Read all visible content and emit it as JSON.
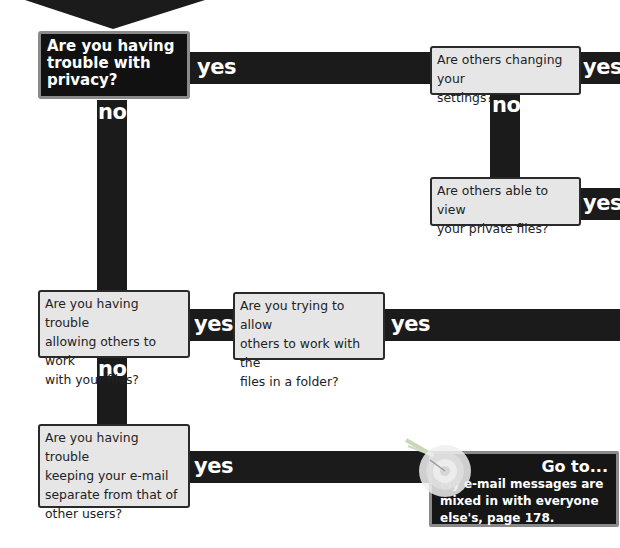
{
  "flowchart": {
    "start": {
      "question": "Are you having trouble with privacy?",
      "lines": [
        "Are you having",
        "trouble with",
        "privacy?"
      ],
      "yes_label": "yes",
      "no_label": "no"
    },
    "settings": {
      "question": "Are others changing your settings?",
      "lines": [
        "Are others changing your",
        "settings?"
      ],
      "yes_label": "yes",
      "no_label": "no"
    },
    "private_files": {
      "question": "Are others able to view your private files?",
      "lines": [
        "Are others able to view",
        "your private files?"
      ],
      "yes_label": "yes"
    },
    "work_files": {
      "question": "Are you having trouble allowing others to work with your files?",
      "lines": [
        "Are you having trouble",
        "allowing others to work",
        "with your files?"
      ],
      "yes_label": "yes",
      "no_label": "no"
    },
    "folder": {
      "question": "Are you trying to allow others to work with the files in a folder?",
      "lines": [
        "Are you trying to allow",
        "others to work with the",
        "files in a folder?"
      ],
      "yes_label": "yes"
    },
    "email": {
      "question": "Are you having trouble keeping your e-mail separate from that of other users?",
      "lines": [
        "Are you having trouble",
        "keeping your e-mail",
        "separate from that of",
        "other users?"
      ],
      "yes_label": "yes"
    },
    "goto": {
      "title": "Go to...",
      "lines": [
        "My e-mail messages are",
        "mixed in with everyone",
        "else's, page 178."
      ],
      "page": "178"
    }
  },
  "colors": {
    "bar": "#1b1b1b",
    "box_fill": "#e6e6e6",
    "dark_box": "#111111",
    "box_border_light": "#8a8a8a",
    "text_on_dark": "#ffffff"
  }
}
